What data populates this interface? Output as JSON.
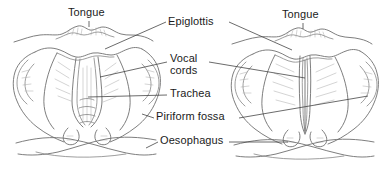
{
  "figure": {
    "background_color": "#ffffff",
    "line_color": "#6f6f6f",
    "text_color": "#1b1b1b",
    "width": 387,
    "height": 174
  },
  "labels": {
    "tongue_left": "Tongue",
    "tongue_right": "Tongue",
    "epiglottis": "Epiglottis",
    "vocal_cords_line1": "Vocal",
    "vocal_cords_line2": "cords",
    "trachea": "Trachea",
    "piriform_fossa": "Piriform fossa",
    "oesophagus": "Oesophagus"
  },
  "views": [
    {
      "side": "left",
      "state": "abducted",
      "description": "Glottis open — vocal cords abducted during quiet breathing, forming a triangular airway"
    },
    {
      "side": "right",
      "state": "adducted",
      "description": "Glottis closed — vocal cords adducted during phonation, forming a narrow slit"
    }
  ],
  "structures": [
    "tongue base",
    "epiglottis",
    "vocal cords",
    "trachea",
    "piriform fossa",
    "oesophagus",
    "aryepiglottic fold",
    "arytenoid"
  ]
}
